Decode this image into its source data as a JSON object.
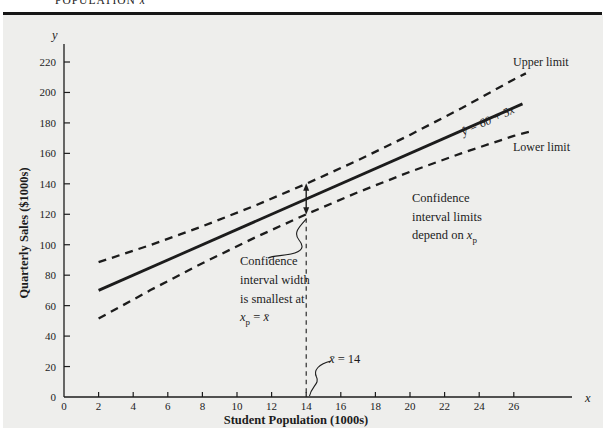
{
  "labels": {
    "caption_pre": "POPULATION ",
    "caption_x": "x",
    "y_letter": "y",
    "x_letter": "x",
    "ylabel": "Quarterly Sales ($1000s)",
    "xlabel": "Student Population (1000s)",
    "upper_limit": "Upper limit",
    "lower_limit": "Lower limit",
    "eq_yhat": "ŷ",
    "eq_mid": " = 60 + 5",
    "eq_x": "x",
    "ann_right_l1": "Confidence",
    "ann_right_l2": "interval limits",
    "ann_right_l3_pre": "depend on ",
    "ann_right_x": "x",
    "ann_right_sub": "p",
    "ann_left_l1": "Confidence",
    "ann_left_l2": "interval width",
    "ann_left_l3": "is smallest at",
    "ann_left_x": "x",
    "ann_left_sub": "p",
    "ann_left_eq": " = ",
    "ann_left_xbar": "x̄",
    "xbar_x": "x̄",
    "xbar_rest": " = 14"
  },
  "colors": {
    "ink": "#1c1c1c",
    "panel_background": "#eeeeec",
    "header_rule": "#161616"
  },
  "chart_data": {
    "type": "line",
    "title": "",
    "xlabel": "Student Population (1000s)",
    "ylabel": "Quarterly Sales ($1000s)",
    "xlim": [
      0,
      28
    ],
    "ylim": [
      0,
      230
    ],
    "grid": false,
    "x_ticks": [
      0,
      2,
      4,
      6,
      8,
      10,
      12,
      14,
      16,
      18,
      20,
      22,
      24,
      26
    ],
    "y_ticks": [
      0,
      20,
      40,
      60,
      80,
      100,
      120,
      140,
      160,
      180,
      200,
      220
    ],
    "series": [
      {
        "name": "estimated-regression-line",
        "label": "ŷ = 60 + 5x",
        "style": "solid",
        "x": [
          2,
          26.5
        ],
        "y": [
          70,
          192.5
        ]
      },
      {
        "name": "upper-confidence-limit",
        "label": "Upper limit",
        "style": "dashed",
        "x": [
          2,
          5,
          8,
          11,
          14,
          17,
          20,
          23,
          26,
          26.7
        ],
        "y": [
          88.5,
          99.8,
          112.1,
          125.5,
          140,
          155.5,
          172.1,
          189.8,
          208.5,
          212.5
        ]
      },
      {
        "name": "lower-confidence-limit",
        "label": "Lower limit",
        "style": "dashed",
        "x": [
          2,
          5,
          8,
          11,
          14,
          17,
          20,
          23,
          26,
          27
        ],
        "y": [
          51.5,
          70.2,
          87.9,
          104.5,
          120,
          134.5,
          147.9,
          160.2,
          171.5,
          174.5
        ]
      }
    ],
    "reference": {
      "xbar": 14,
      "xbar_label": "x̄ = 14",
      "interval_at_xbar": {
        "upper": 140,
        "lower": 120
      }
    },
    "annotations": [
      "Upper limit",
      "Lower limit",
      "ŷ = 60 + 5x",
      "Confidence interval limits depend on xp",
      "Confidence interval width is smallest at xp = x̄",
      "x̄ = 14"
    ]
  }
}
